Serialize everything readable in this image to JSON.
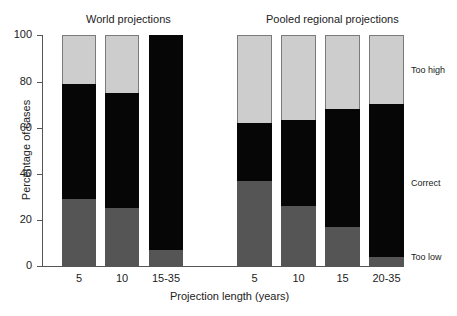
{
  "chart_data": {
    "type": "bar",
    "stacked": true,
    "ylabel": "Percentage of cases",
    "xlabel": "Projection length (years)",
    "ylim": [
      0,
      100
    ],
    "yticks": [
      0,
      20,
      40,
      60,
      80,
      100
    ],
    "grid": false,
    "legend_position": "right (inline labels)",
    "groups": [
      {
        "title": "World projections",
        "categories": [
          "5",
          "10",
          "15-35"
        ],
        "series": [
          {
            "name": "Too low",
            "values": [
              29,
              25,
              7
            ]
          },
          {
            "name": "Correct",
            "values": [
              50,
              50,
              93
            ]
          },
          {
            "name": "Too high",
            "values": [
              21,
              25,
              0
            ]
          }
        ]
      },
      {
        "title": "Pooled regional projections",
        "categories": [
          "5",
          "10",
          "15",
          "20-35"
        ],
        "series": [
          {
            "name": "Too low",
            "values": [
              37,
              26,
              17,
              4
            ]
          },
          {
            "name": "Correct",
            "values": [
              25,
              37,
              51,
              66
            ]
          },
          {
            "name": "Too high",
            "values": [
              38,
              37,
              32,
              30
            ]
          }
        ]
      }
    ],
    "colors": {
      "Too low": "#555555",
      "Correct": "#060606",
      "Too high": "#cdcdcd"
    }
  },
  "labels": {
    "world_title": "World projections",
    "regional_title": "Pooled regional projections",
    "ylabel": "Percentage of cases",
    "xlabel": "Projection length (years)",
    "legend_high": "Too high",
    "legend_correct": "Correct",
    "legend_low": "Too low",
    "yticks": [
      "0",
      "20",
      "40",
      "60",
      "80",
      "100"
    ],
    "xticks": [
      "5",
      "10",
      "15-35",
      "5",
      "10",
      "15",
      "20-35"
    ]
  }
}
